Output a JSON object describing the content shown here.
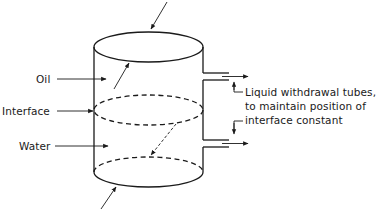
{
  "diagram": {
    "labels": {
      "oil": "Oil",
      "interface": "Interface",
      "water": "Water"
    },
    "annotation": {
      "line1": "Liquid withdrawal tubes,",
      "line2": "to maintain position of",
      "line3": "interface constant"
    },
    "colors": {
      "line": "#1a1a1a",
      "background": "#ffffff"
    }
  }
}
